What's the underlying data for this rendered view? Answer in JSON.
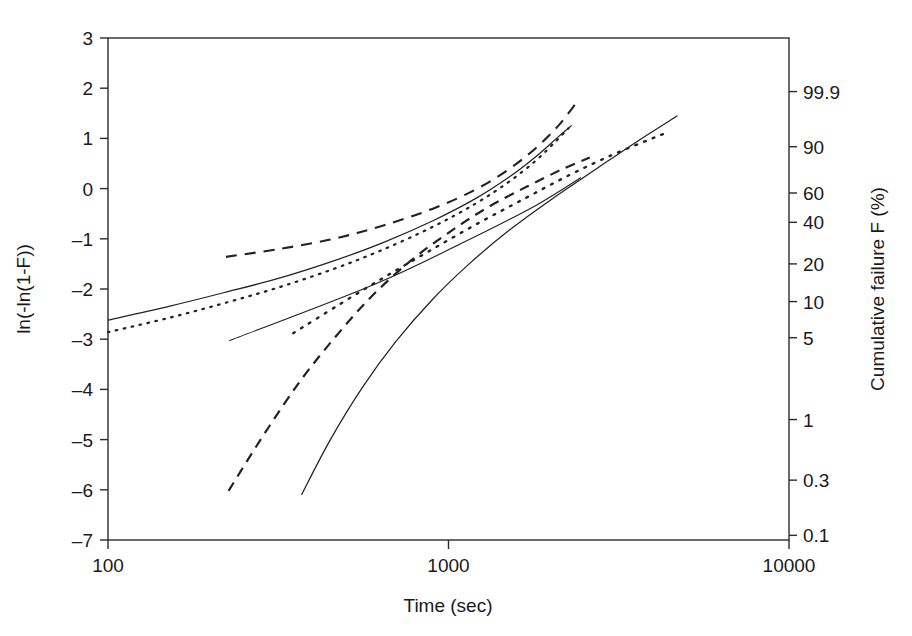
{
  "chart_data": {
    "type": "line",
    "title": "",
    "xlabel": "Time (sec)",
    "ylabel": "ln(-ln(1-F))",
    "y2label": "Cumulative failure F (%)",
    "xscale": "log",
    "xlim": [
      100,
      10000
    ],
    "ylim": [
      -7,
      3
    ],
    "grid": false,
    "legend": "none",
    "xticks": [
      "100",
      "1000",
      "10000"
    ],
    "xtick_values": [
      100,
      1000,
      10000
    ],
    "yticks": [
      "3",
      "2",
      "1",
      "0",
      "-1",
      "-2",
      "-3",
      "-4",
      "-5",
      "-6",
      "-7"
    ],
    "ytick_values": [
      3,
      2,
      1,
      0,
      -1,
      -2,
      -3,
      -4,
      -5,
      -6,
      -7
    ],
    "y2ticks": [
      "99.9",
      "90",
      "60",
      "40",
      "20",
      "10",
      "5",
      "1",
      "0.3",
      "0.1"
    ],
    "y2tick_values": [
      99.9,
      90,
      60,
      40,
      20,
      10,
      5,
      1,
      0.3,
      0.1
    ],
    "series": [
      {
        "name": "left-group-solid-curve",
        "style": "solid",
        "points": [
          [
            100,
            -2.62
          ],
          [
            150,
            -2.35
          ],
          [
            220,
            -2.07
          ],
          [
            320,
            -1.78
          ],
          [
            460,
            -1.44
          ],
          [
            640,
            -1.08
          ],
          [
            900,
            -0.64
          ],
          [
            1200,
            -0.2
          ],
          [
            1500,
            0.22
          ],
          [
            1800,
            0.63
          ],
          [
            2100,
            1.03
          ],
          [
            2300,
            1.26
          ]
        ]
      },
      {
        "name": "left-group-dotted-curve",
        "style": "dotted",
        "points": [
          [
            100,
            -2.86
          ],
          [
            150,
            -2.58
          ],
          [
            220,
            -2.28
          ],
          [
            320,
            -1.96
          ],
          [
            460,
            -1.6
          ],
          [
            640,
            -1.22
          ],
          [
            900,
            -0.76
          ],
          [
            1200,
            -0.3
          ],
          [
            1500,
            0.13
          ],
          [
            1800,
            0.55
          ],
          [
            2050,
            0.92
          ],
          [
            2250,
            1.2
          ]
        ]
      },
      {
        "name": "left-group-dashed-curve",
        "style": "dashed",
        "points": [
          [
            222,
            -1.36
          ],
          [
            320,
            -1.2
          ],
          [
            460,
            -1.0
          ],
          [
            640,
            -0.74
          ],
          [
            900,
            -0.4
          ],
          [
            1200,
            -0.02
          ],
          [
            1500,
            0.38
          ],
          [
            1800,
            0.8
          ],
          [
            2100,
            1.25
          ],
          [
            2380,
            1.72
          ]
        ]
      },
      {
        "name": "right-group-thin-straight-line",
        "style": "thin",
        "points": [
          [
            227,
            -3.03
          ],
          [
            600,
            -1.92
          ],
          [
            1100,
            -1.08
          ],
          [
            1800,
            -0.34
          ],
          [
            2450,
            0.22
          ]
        ]
      },
      {
        "name": "right-group-solid-curve",
        "style": "solid",
        "points": [
          [
            370,
            -6.1
          ],
          [
            450,
            -5.0
          ],
          [
            560,
            -3.95
          ],
          [
            700,
            -3.05
          ],
          [
            900,
            -2.2
          ],
          [
            1150,
            -1.5
          ],
          [
            1500,
            -0.84
          ],
          [
            2000,
            -0.22
          ],
          [
            2700,
            0.38
          ],
          [
            3600,
            0.95
          ],
          [
            4700,
            1.45
          ]
        ]
      },
      {
        "name": "right-group-dashed-curve",
        "style": "dashed2",
        "points": [
          [
            226,
            -6.02
          ],
          [
            290,
            -4.85
          ],
          [
            370,
            -3.8
          ],
          [
            470,
            -2.92
          ],
          [
            600,
            -2.12
          ],
          [
            780,
            -1.42
          ],
          [
            1000,
            -0.88
          ],
          [
            1300,
            -0.38
          ],
          [
            1700,
            0.04
          ],
          [
            2150,
            0.38
          ],
          [
            2600,
            0.62
          ]
        ]
      },
      {
        "name": "right-group-dotted-curve",
        "style": "dotted2",
        "points": [
          [
            350,
            -2.88
          ],
          [
            480,
            -2.3
          ],
          [
            650,
            -1.76
          ],
          [
            880,
            -1.24
          ],
          [
            1200,
            -0.72
          ],
          [
            1650,
            -0.22
          ],
          [
            2250,
            0.26
          ],
          [
            3000,
            0.66
          ],
          [
            3900,
            0.98
          ],
          [
            4400,
            1.12
          ]
        ]
      }
    ]
  },
  "axes": {
    "x_title": "Time (sec)",
    "y_title": "ln(-ln(1-F))",
    "y2_title": "Cumulative failure F (%)"
  }
}
